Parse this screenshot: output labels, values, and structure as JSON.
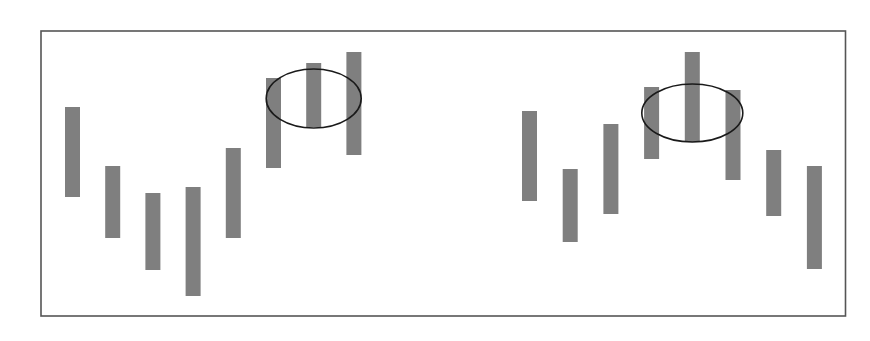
{
  "chart_data": {
    "type": "bar",
    "subtype": "floating-range",
    "title": "",
    "xlabel": "",
    "ylabel": "",
    "grid": false,
    "legend": "none",
    "y_axis_direction": "up",
    "colors": {
      "bar": "#7f7f7f",
      "frame": "#555555",
      "highlight_ellipse": "#1a1a1a",
      "background": "#ffffff"
    },
    "panels": [
      {
        "name": "left",
        "pattern": "rising-then-cluster-at-top",
        "bars": [
          {
            "low": 120,
            "high": 210
          },
          {
            "low": 79,
            "high": 151
          },
          {
            "low": 47,
            "high": 124
          },
          {
            "low": 21,
            "high": 130
          },
          {
            "low": 79,
            "high": 169
          },
          {
            "low": 149,
            "high": 239
          },
          {
            "low": 190,
            "high": 254
          },
          {
            "low": 162,
            "high": 265
          }
        ],
        "highlight": {
          "bars": [
            6,
            7,
            8
          ],
          "center_value": 218.5
        }
      },
      {
        "name": "right",
        "pattern": "peak-then-falling",
        "bars": [
          {
            "low": 116,
            "high": 206
          },
          {
            "low": 75,
            "high": 148
          },
          {
            "low": 103,
            "high": 193
          },
          {
            "low": 158,
            "high": 230
          },
          {
            "low": 175,
            "high": 265
          },
          {
            "low": 137,
            "high": 227
          },
          {
            "low": 101,
            "high": 167
          },
          {
            "low": 48,
            "high": 151
          }
        ],
        "highlight": {
          "bars": [
            4,
            5,
            6
          ],
          "center_value": 204
        }
      }
    ],
    "value_range": [
      0,
      317
    ]
  }
}
